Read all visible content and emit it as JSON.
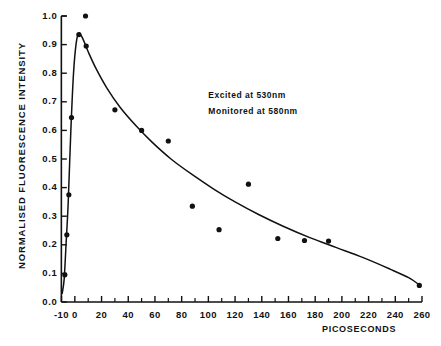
{
  "chart_data": {
    "type": "scatter",
    "title": "",
    "xlabel": "PICOSECONDS",
    "ylabel": "NORMALISED FLUORESCENCE INTENSITY",
    "xlim": [
      -10,
      260
    ],
    "ylim": [
      0.0,
      1.0
    ],
    "grid": false,
    "legend": "none",
    "x_ticks": [
      -10,
      0,
      20,
      40,
      60,
      80,
      100,
      120,
      140,
      160,
      180,
      200,
      220,
      240,
      260
    ],
    "x_tick_labels": [
      "-10",
      "0",
      "20",
      "40",
      "60",
      "80",
      "100",
      "120",
      "140",
      "160",
      "180",
      "200",
      "220",
      "240",
      "260"
    ],
    "x_minor_ticks": [
      10,
      30,
      50,
      70,
      90,
      110,
      130,
      150,
      170,
      190,
      210,
      230,
      250
    ],
    "y_ticks": [
      0.0,
      0.1,
      0.2,
      0.3,
      0.4,
      0.5,
      0.6,
      0.7,
      0.8,
      0.9,
      1.0
    ],
    "y_tick_labels": [
      "0.0",
      "0.1",
      "0.2",
      "0.3",
      "0.4",
      "0.5",
      "0.6",
      "0.7",
      "0.8",
      "0.9",
      "1.0"
    ],
    "annotations": [
      {
        "text": "Excited at 530nm",
        "x": 100,
        "y": 0.72
      },
      {
        "text": "Monitored at 580nm",
        "x": 100,
        "y": 0.665
      }
    ],
    "series": [
      {
        "name": "measured points",
        "marker": "filled-circle",
        "color": "#111111",
        "points": [
          {
            "x": -7.5,
            "y": 0.095
          },
          {
            "x": -6.0,
            "y": 0.235
          },
          {
            "x": -4.5,
            "y": 0.375
          },
          {
            "x": -2.5,
            "y": 0.645
          },
          {
            "x": 3.0,
            "y": 0.935
          },
          {
            "x": 8.0,
            "y": 1.0
          },
          {
            "x": 8.5,
            "y": 0.895
          },
          {
            "x": 30.0,
            "y": 0.672
          },
          {
            "x": 50.0,
            "y": 0.6
          },
          {
            "x": 70.0,
            "y": 0.563
          },
          {
            "x": 88.0,
            "y": 0.335
          },
          {
            "x": 108.0,
            "y": 0.253
          },
          {
            "x": 130.0,
            "y": 0.412
          },
          {
            "x": 152.0,
            "y": 0.222
          },
          {
            "x": 172.0,
            "y": 0.215
          },
          {
            "x": 190.0,
            "y": 0.213
          },
          {
            "x": 258.0,
            "y": 0.058
          }
        ]
      },
      {
        "name": "fitted decay curve",
        "marker": "none",
        "line": "solid",
        "color": "#111111",
        "points": [
          {
            "x": -9.5,
            "y": 0.03
          },
          {
            "x": -8.0,
            "y": 0.08
          },
          {
            "x": -6.5,
            "y": 0.21
          },
          {
            "x": -5.0,
            "y": 0.345
          },
          {
            "x": -3.0,
            "y": 0.6
          },
          {
            "x": -1.0,
            "y": 0.8
          },
          {
            "x": 1.0,
            "y": 0.905
          },
          {
            "x": 3.0,
            "y": 0.94
          },
          {
            "x": 6.0,
            "y": 0.92
          },
          {
            "x": 10.0,
            "y": 0.875
          },
          {
            "x": 16.0,
            "y": 0.815
          },
          {
            "x": 24.0,
            "y": 0.748
          },
          {
            "x": 34.0,
            "y": 0.68
          },
          {
            "x": 46.0,
            "y": 0.615
          },
          {
            "x": 58.0,
            "y": 0.558
          },
          {
            "x": 72.0,
            "y": 0.5
          },
          {
            "x": 88.0,
            "y": 0.445
          },
          {
            "x": 104.0,
            "y": 0.395
          },
          {
            "x": 120.0,
            "y": 0.35
          },
          {
            "x": 138.0,
            "y": 0.305
          },
          {
            "x": 156.0,
            "y": 0.265
          },
          {
            "x": 176.0,
            "y": 0.225
          },
          {
            "x": 196.0,
            "y": 0.19
          },
          {
            "x": 216.0,
            "y": 0.155
          },
          {
            "x": 236.0,
            "y": 0.115
          },
          {
            "x": 250.0,
            "y": 0.085
          },
          {
            "x": 258.0,
            "y": 0.06
          }
        ]
      }
    ]
  }
}
